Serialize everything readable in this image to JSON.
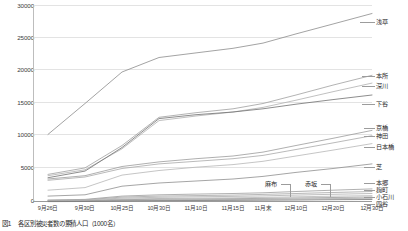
{
  "caption": {
    "number": "図1",
    "text": "各区別被災者数の累積人口（1000名）"
  },
  "chart_data": {
    "type": "line",
    "title": "",
    "xlabel": "",
    "ylabel": "",
    "ylim": [
      0,
      30000
    ],
    "yticks": [
      0,
      5000,
      10000,
      15000,
      20000,
      25000,
      30000
    ],
    "ytick_labels": [
      "0",
      "5000",
      "10000",
      "15000",
      "20000",
      "25000",
      "30000"
    ],
    "grid": true,
    "legend_position": "right-inline",
    "categories": [
      "9月26日",
      "9月30日",
      "10月25日",
      "10月30日",
      "11月10日",
      "11月15日",
      "11月末",
      "12月10日",
      "12月20日",
      "12月30日"
    ],
    "series": [
      {
        "name": "浅草",
        "color": "#8c8c8c",
        "label_y": 22,
        "values": [
          10300,
          15000,
          19800,
          22000,
          22700,
          23400,
          24200,
          25600,
          27100,
          28700
        ]
      },
      {
        "name": "本所",
        "color": "#a0a0a0",
        "label_y": 76,
        "values": [
          4200,
          5200,
          8600,
          12900,
          13600,
          14200,
          15000,
          16300,
          17800,
          19300
        ]
      },
      {
        "name": "深川",
        "color": "#b0b0b0",
        "label_y": 86,
        "values": [
          4000,
          4900,
          8100,
          12400,
          13100,
          13700,
          14400,
          15500,
          16800,
          18100
        ]
      },
      {
        "name": "下谷",
        "color": "#707070",
        "label_y": 103,
        "values": [
          3700,
          4700,
          8300,
          12700,
          13300,
          13700,
          14200,
          14900,
          15600,
          16300
        ]
      },
      {
        "name": "京橋",
        "color": "#9a9a9a",
        "label_y": 128,
        "values": [
          3500,
          4000,
          5400,
          6100,
          6600,
          7000,
          7600,
          8600,
          9700,
          10900
        ]
      },
      {
        "name": "神田",
        "color": "#a8a8a8",
        "label_y": 136,
        "values": [
          3300,
          3800,
          5100,
          5800,
          6200,
          6600,
          7100,
          8000,
          9000,
          10100
        ]
      },
      {
        "name": "日本橋",
        "color": "#b6b6b6",
        "label_y": 146,
        "values": [
          1800,
          2200,
          4100,
          4800,
          5300,
          5700,
          6200,
          7000,
          7900,
          8900
        ]
      },
      {
        "name": "芝",
        "color": "#8e8e8e",
        "label_y": 166,
        "values": [
          900,
          1100,
          2400,
          2900,
          3200,
          3500,
          3900,
          4500,
          5100,
          5800
        ]
      },
      {
        "name": "本郷",
        "color": "#9c9c9c",
        "label_y": 182,
        "values": [
          300,
          400,
          900,
          1100,
          1200,
          1300,
          1400,
          1600,
          1800,
          2000
        ]
      },
      {
        "name": "麹町",
        "color": "#a4a4a4",
        "label_y": 189,
        "values": [
          250,
          330,
          750,
          900,
          980,
          1050,
          1150,
          1300,
          1450,
          1600
        ]
      },
      {
        "name": "小石川",
        "color": "#aeaeae",
        "label_y": 196,
        "values": [
          200,
          270,
          600,
          720,
          790,
          850,
          930,
          1050,
          1180,
          1300
        ]
      },
      {
        "name": "四谷",
        "color": "#b8b8b8",
        "label_y": 203,
        "values": [
          150,
          200,
          450,
          540,
          590,
          640,
          700,
          790,
          880,
          980
        ]
      },
      {
        "name": "麻布",
        "color": "#999999",
        "label_y": 0,
        "values": [
          120,
          160,
          350,
          420,
          460,
          500,
          545,
          615,
          690,
          760
        ]
      },
      {
        "name": "赤坂",
        "color": "#a6a6a6",
        "label_y": 0,
        "values": [
          90,
          120,
          260,
          310,
          345,
          375,
          410,
          460,
          515,
          570
        ]
      },
      {
        "name": "その他",
        "color": "#777777",
        "label_y": 0,
        "values": [
          60,
          80,
          170,
          210,
          230,
          250,
          275,
          310,
          345,
          380
        ]
      }
    ],
    "callouts": [
      {
        "name": "麻布"
      },
      {
        "name": "赤坂"
      }
    ]
  }
}
